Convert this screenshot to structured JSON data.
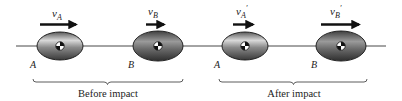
{
  "diagram": {
    "colors": {
      "line": "#333333",
      "body_dark": "#3a3a3a",
      "body_light": "#e8e8e8",
      "arrow": "#111111",
      "text": "#222222"
    },
    "panels": [
      {
        "caption": "Before impact",
        "bodies": [
          {
            "label": "A",
            "velocity_symbol": "v",
            "velocity_subscript": "A",
            "prime": ""
          },
          {
            "label": "B",
            "velocity_symbol": "v",
            "velocity_subscript": "B",
            "prime": ""
          }
        ]
      },
      {
        "caption": "After impact",
        "bodies": [
          {
            "label": "A",
            "velocity_symbol": "v",
            "velocity_subscript": "A",
            "prime": "′"
          },
          {
            "label": "B",
            "velocity_symbol": "v",
            "velocity_subscript": "B",
            "prime": "′"
          }
        ]
      }
    ]
  }
}
